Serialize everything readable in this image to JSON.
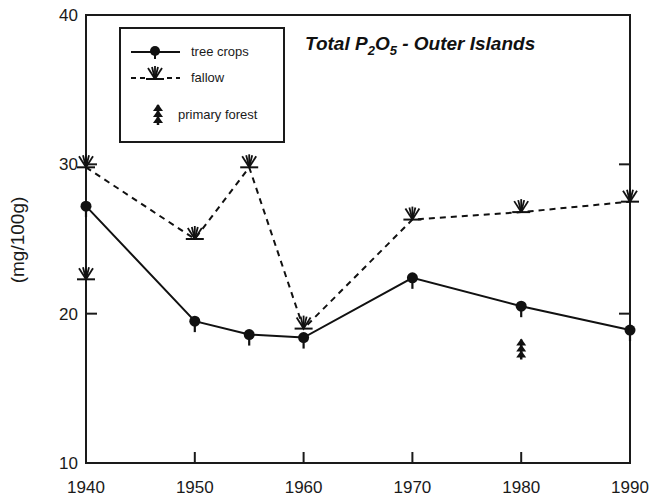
{
  "chart_data": {
    "type": "line",
    "title": "Total P2O5 - Outer Islands",
    "title_parts": {
      "pre": "Total P",
      "sub1": "2",
      "mid": "O",
      "sub2": "5",
      "post": " - Outer Islands"
    },
    "xlabel": "",
    "ylabel": "(mg/100g)",
    "xlim": [
      1940,
      1990
    ],
    "ylim": [
      10,
      40
    ],
    "x_ticks": [
      1940,
      1950,
      1960,
      1970,
      1980,
      1990
    ],
    "y_ticks": [
      10,
      20,
      30,
      40
    ],
    "grid": false,
    "legend_position": "upper-left",
    "series": [
      {
        "name": "tree crops",
        "style": "solid",
        "marker": "filled-circle-with-stem",
        "points": [
          {
            "x": 1940,
            "y": 27.2
          },
          {
            "x": 1950,
            "y": 19.5
          },
          {
            "x": 1955,
            "y": 18.6
          },
          {
            "x": 1960,
            "y": 18.4
          },
          {
            "x": 1970,
            "y": 22.4
          },
          {
            "x": 1980,
            "y": 20.5
          },
          {
            "x": 1990,
            "y": 18.9
          }
        ]
      },
      {
        "name": "fallow",
        "style": "dashed",
        "marker": "grass-tuft",
        "points": [
          {
            "x": 1940,
            "y": 29.8
          },
          {
            "x": 1950,
            "y": 25.0
          },
          {
            "x": 1955,
            "y": 29.8
          },
          {
            "x": 1960,
            "y": 19.0
          },
          {
            "x": 1970,
            "y": 26.3
          },
          {
            "x": 1980,
            "y": 26.8
          },
          {
            "x": 1990,
            "y": 27.5
          }
        ],
        "extra_points": [
          {
            "x": 1940,
            "y": 22.3
          }
        ]
      },
      {
        "name": "primary forest",
        "style": "none",
        "marker": "tree-icon",
        "points": [
          {
            "x": 1980,
            "y": 17.6
          }
        ]
      }
    ]
  },
  "legend": {
    "items": [
      {
        "label": "tree crops"
      },
      {
        "label": "fallow"
      },
      {
        "label": "primary forest"
      }
    ]
  },
  "axes": {
    "y_label": "(mg/100g)",
    "x_tick_labels": [
      "1940",
      "1950",
      "1960",
      "1970",
      "1980",
      "1990"
    ],
    "y_tick_labels": [
      "10",
      "20",
      "30",
      "40"
    ]
  }
}
